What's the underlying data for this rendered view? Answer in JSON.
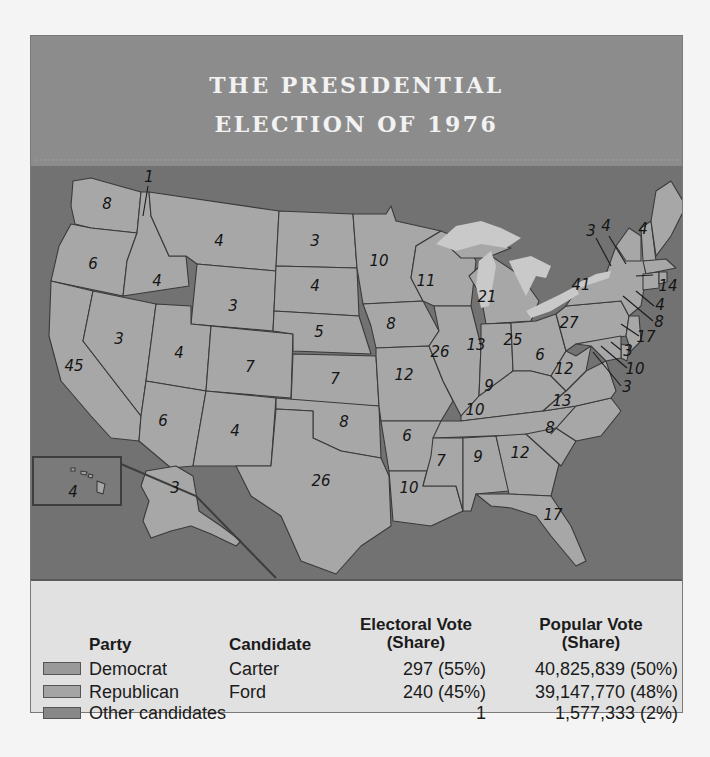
{
  "title": {
    "line1": "THE PRESIDENTIAL",
    "line2": "ELECTION OF 1976"
  },
  "colors": {
    "title_band": "#8c8c8c",
    "ocean": "#727272",
    "democrat": "#a7a7a7",
    "republican": "#aaaaaa",
    "other": "#8a8a8a",
    "lakes": "#c9c9c9",
    "legend_bg": "#e1e1e1"
  },
  "map": {
    "states": [
      {
        "state": "WA",
        "ev": "8"
      },
      {
        "state": "OR",
        "ev": "6"
      },
      {
        "state": "CA",
        "ev": "45"
      },
      {
        "state": "ID",
        "ev": "4"
      },
      {
        "state": "NV",
        "ev": "3"
      },
      {
        "state": "MT",
        "ev": "4"
      },
      {
        "state": "WY",
        "ev": "3"
      },
      {
        "state": "UT",
        "ev": "4"
      },
      {
        "state": "AZ",
        "ev": "6"
      },
      {
        "state": "CO",
        "ev": "7"
      },
      {
        "state": "NM",
        "ev": "4"
      },
      {
        "state": "ND",
        "ev": "3"
      },
      {
        "state": "SD",
        "ev": "4"
      },
      {
        "state": "NE",
        "ev": "5"
      },
      {
        "state": "KS",
        "ev": "7"
      },
      {
        "state": "OK",
        "ev": "8"
      },
      {
        "state": "TX",
        "ev": "26"
      },
      {
        "state": "MN",
        "ev": "10"
      },
      {
        "state": "IA",
        "ev": "8"
      },
      {
        "state": "MO",
        "ev": "12"
      },
      {
        "state": "AR",
        "ev": "6"
      },
      {
        "state": "LA",
        "ev": "10"
      },
      {
        "state": "WI",
        "ev": "11"
      },
      {
        "state": "IL",
        "ev": "26"
      },
      {
        "state": "MI",
        "ev": "21"
      },
      {
        "state": "IN",
        "ev": "13"
      },
      {
        "state": "OH",
        "ev": "25"
      },
      {
        "state": "KY",
        "ev": "9"
      },
      {
        "state": "TN",
        "ev": "10"
      },
      {
        "state": "MS",
        "ev": "7"
      },
      {
        "state": "AL",
        "ev": "9"
      },
      {
        "state": "GA",
        "ev": "12"
      },
      {
        "state": "FL",
        "ev": "17"
      },
      {
        "state": "SC",
        "ev": "8"
      },
      {
        "state": "NC",
        "ev": "13"
      },
      {
        "state": "VA",
        "ev": "12"
      },
      {
        "state": "WV",
        "ev": "6"
      },
      {
        "state": "PA",
        "ev": "27"
      },
      {
        "state": "NY",
        "ev": "41"
      },
      {
        "state": "VT",
        "ev": "3"
      },
      {
        "state": "NH",
        "ev": "4"
      },
      {
        "state": "ME",
        "ev": "4"
      },
      {
        "state": "MA",
        "ev": "14"
      },
      {
        "state": "RI",
        "ev": "4"
      },
      {
        "state": "CT",
        "ev": "8"
      },
      {
        "state": "NJ",
        "ev": "17"
      },
      {
        "state": "DE",
        "ev": "3"
      },
      {
        "state": "MD",
        "ev": "10"
      },
      {
        "state": "DC",
        "ev": "3"
      },
      {
        "state": "AK",
        "ev": "3"
      },
      {
        "state": "HI",
        "ev": "4"
      },
      {
        "state": "WA-faithless",
        "ev": "1"
      }
    ]
  },
  "legend": {
    "headers": {
      "party": "Party",
      "candidate": "Candidate",
      "electoral_l1": "Electoral Vote",
      "electoral_l2": "(Share)",
      "popular_l1": "Popular Vote",
      "popular_l2": "(Share)"
    },
    "rows": [
      {
        "party": "Democrat",
        "candidate": "Carter",
        "electoral": "297 (55%)",
        "popular": "40,825,839 (50%)"
      },
      {
        "party": "Republican",
        "candidate": "Ford",
        "electoral": "240 (45%)",
        "popular": "39,147,770 (48%)"
      },
      {
        "party": "Other candidates",
        "candidate": "",
        "electoral": "1",
        "popular": "1,577,333 (2%)"
      }
    ]
  }
}
